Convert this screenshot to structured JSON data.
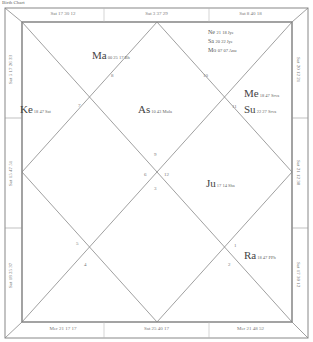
{
  "caption": "Birth Chart",
  "strips": {
    "top": [
      "Sat 17 30 12",
      "Sat 3 37 29",
      "Sat 8 40 18"
    ],
    "bottom": [
      "Mer 21 17 17",
      "Sat 25 40 17",
      "Mer 21 48 52"
    ],
    "left": [
      "Sat 5 17 26 33",
      "Sat 15 47 51",
      "Sat 18 25 37"
    ],
    "right": [
      "Sat 20 12 21",
      "Sat 21 12 38",
      "Sat 17 30 12"
    ]
  },
  "planets": {
    "ma": {
      "abbr": "Ma",
      "deg": "00 25 17 Bh"
    },
    "ke": {
      "abbr": "Ke",
      "deg": "18 47 Sat"
    },
    "as": {
      "abbr": "As",
      "deg": "10 43 Mula"
    },
    "ne": {
      "abbr": "Ne",
      "deg": "21 18 Jye"
    },
    "sa": {
      "abbr": "Sa",
      "deg": "20 22 Jye"
    },
    "mo": {
      "abbr": "Mo",
      "deg": "07 07 Anu"
    },
    "me": {
      "abbr": "Me",
      "deg": "18 47 Srva"
    },
    "su": {
      "abbr": "Su",
      "deg": "22 27 Srva"
    },
    "ju": {
      "abbr": "Ju",
      "deg": "17 14 Sha"
    },
    "ra": {
      "abbr": "Ra",
      "deg": "18 47 PPh"
    }
  },
  "signs": {
    "h1": "9",
    "h2": "8",
    "h3": "7",
    "h4": "6",
    "h5": "5",
    "h6": "4",
    "h7": "3",
    "h8": "2",
    "h9": "1",
    "h10": "12",
    "h11": "11",
    "h12": "10"
  }
}
